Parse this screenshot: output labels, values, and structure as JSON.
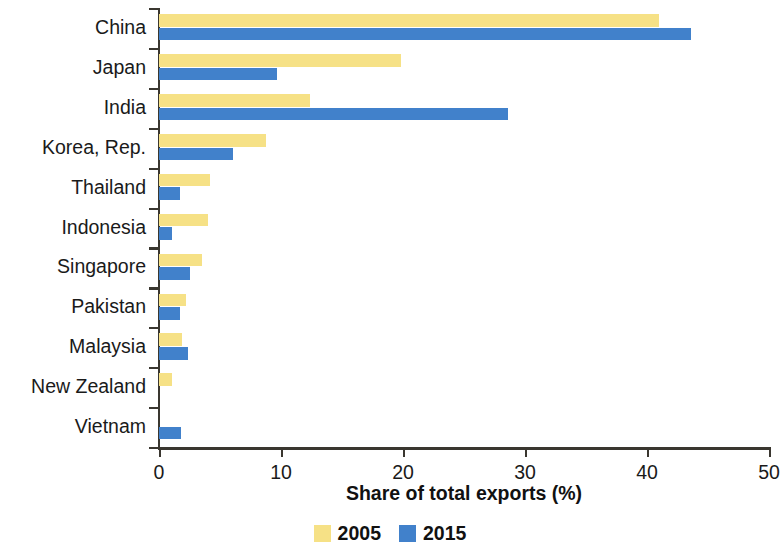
{
  "chart_data": {
    "type": "bar",
    "orientation": "horizontal",
    "title": "",
    "xlabel": "Share of total exports (%)",
    "ylabel": "",
    "xlim": [
      0,
      50
    ],
    "xticks": [
      "0",
      "10",
      "20",
      "30",
      "40",
      "50"
    ],
    "grid": false,
    "legend_position": "bottom",
    "categories": [
      "China",
      "Japan",
      "India",
      "Korea, Rep.",
      "Thailand",
      "Indonesia",
      "Singapore",
      "Pakistan",
      "Malaysia",
      "New Zealand",
      "Vietnam"
    ],
    "series": [
      {
        "name": "2005",
        "color": "#F6E186",
        "values": [
          41.0,
          19.8,
          12.4,
          8.8,
          4.2,
          4.0,
          3.5,
          2.2,
          1.9,
          1.1,
          0
        ]
      },
      {
        "name": "2015",
        "color": "#4181CB",
        "values": [
          43.6,
          9.7,
          28.6,
          6.1,
          1.7,
          1.1,
          2.5,
          1.7,
          2.4,
          0,
          1.8
        ]
      }
    ]
  },
  "legend": {
    "items": [
      {
        "label": "2005",
        "color": "#F6E186"
      },
      {
        "label": "2015",
        "color": "#4181CB"
      }
    ]
  },
  "axis": {
    "line_color": "#3a3730"
  }
}
